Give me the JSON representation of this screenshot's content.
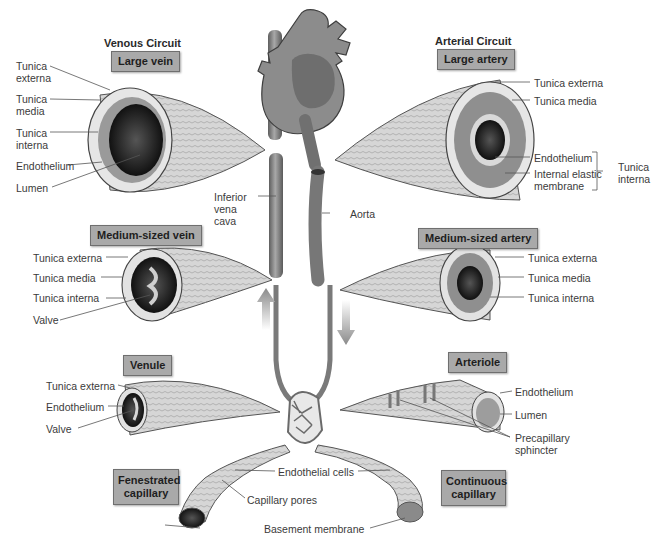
{
  "venous": {
    "heading": "Venous Circuit",
    "large_vein": {
      "title": "Large vein",
      "labels": [
        "Tunica externa",
        "Tunica media",
        "Tunica interna",
        "Endothelium",
        "Lumen"
      ]
    },
    "medium_vein": {
      "title": "Medium-sized vein",
      "labels": [
        "Tunica externa",
        "Tunica media",
        "Tunica interna",
        "Valve"
      ]
    },
    "venule": {
      "title": "Venule",
      "labels": [
        "Tunica externa",
        "Endothelium",
        "Valve"
      ]
    }
  },
  "arterial": {
    "heading": "Arterial Circuit",
    "large_artery": {
      "title": "Large artery",
      "labels": [
        "Tunica externa",
        "Tunica media",
        "Endothelium",
        "Internal elastic membrane"
      ],
      "bracket_label": "Tunica interna"
    },
    "medium_artery": {
      "title": "Medium-sized artery",
      "labels": [
        "Tunica externa",
        "Tunica media",
        "Tunica interna"
      ]
    },
    "arteriole": {
      "title": "Arteriole",
      "labels": [
        "Endothelium",
        "Lumen",
        "Precapillary sphincter"
      ]
    }
  },
  "center": {
    "inferior_vena_cava": "Inferior vena cava",
    "aorta": "Aorta"
  },
  "capillaries": {
    "fenestrated": "Fenestrated capillary",
    "continuous": "Continuous capillary",
    "labels": {
      "endothelial_cells": "Endothelial cells",
      "capillary_pores": "Capillary pores",
      "basement_membrane": "Basement membrane"
    }
  },
  "colors": {
    "label_box_fill": "#a9a9a9",
    "vessel_gray": "#7a7a7a",
    "leader_line": "#555555"
  }
}
